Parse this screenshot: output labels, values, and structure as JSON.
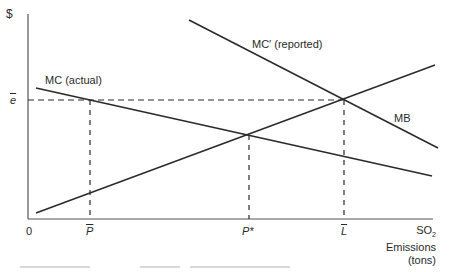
{
  "diagram": {
    "y_axis_label": "$",
    "x_axis": {
      "origin_label": "0",
      "ticks": [
        {
          "label": "P",
          "style": "overbar-italic"
        },
        {
          "label": "P*",
          "style": "italic"
        },
        {
          "label": "L",
          "style": "overbar-italic"
        }
      ],
      "title_line1": "SO",
      "title_subscript": "2",
      "title_line2": "Emissions",
      "title_line3": "(tons)"
    },
    "y_tick": {
      "label": "e",
      "style": "overbar-italic"
    },
    "curves": [
      {
        "name": "MC (actual)",
        "label": "MC (actual)",
        "slope": "down"
      },
      {
        "name": "MC' (reported)",
        "label": "MC′ (reported)",
        "slope": "down"
      },
      {
        "name": "MB",
        "label": "MB",
        "slope": "down"
      },
      {
        "name": "rising-line",
        "label": "",
        "slope": "up"
      }
    ],
    "colors": {
      "line": "#2a2a2a",
      "background": "#ffffff"
    }
  }
}
